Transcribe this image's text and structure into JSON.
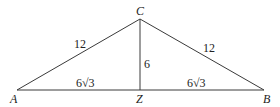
{
  "diagram": {
    "type": "triangle with altitude",
    "vertices": {
      "A": {
        "label": "A",
        "x": 17,
        "y": 90
      },
      "B": {
        "label": "B",
        "x": 264,
        "y": 90
      },
      "C": {
        "label": "C",
        "x": 140,
        "y": 19
      },
      "Z": {
        "label": "Z",
        "x": 140,
        "y": 90
      }
    },
    "segments": [
      {
        "from": "A",
        "to": "C",
        "length_label": "12"
      },
      {
        "from": "C",
        "to": "B",
        "length_label": "12"
      },
      {
        "from": "A",
        "to": "Z",
        "length_label": "6√3"
      },
      {
        "from": "Z",
        "to": "B",
        "length_label": "6√3"
      },
      {
        "from": "C",
        "to": "Z",
        "length_label": "6"
      }
    ],
    "labels": {
      "AC": "12",
      "CB": "12",
      "AZ": "6√3",
      "ZB": "6√3",
      "CZ": "6"
    },
    "colors": {
      "line": "#3a3a3a",
      "text": "#222222",
      "background": "#ffffff"
    }
  }
}
